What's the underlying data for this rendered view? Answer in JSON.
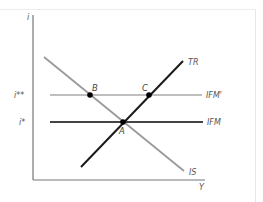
{
  "diagram": {
    "type": "economics-graph",
    "axes": {
      "y_label": "i",
      "x_label": "Y"
    },
    "y_ticks": [
      {
        "label": "i**",
        "refers_to": "IFM'"
      },
      {
        "label": "i*",
        "refers_to": "IFM"
      }
    ],
    "curves": [
      {
        "id": "IS",
        "label": "IS",
        "color": "#9a9a9a",
        "description": "downward-sloping IS curve"
      },
      {
        "id": "TR",
        "label": "TR",
        "color": "#1a1a1a",
        "description": "upward-sloping TR curve"
      },
      {
        "id": "IFM",
        "label": "IFM",
        "color": "#444444",
        "description": "horizontal IFM line at i*"
      },
      {
        "id": "IFMp",
        "label": "IFM'",
        "color": "#a8a8a8",
        "description": "horizontal IFM' line at i**"
      }
    ],
    "points": [
      {
        "label": "A",
        "on": [
          "IS",
          "TR",
          "IFM"
        ]
      },
      {
        "label": "B",
        "on": [
          "IS",
          "IFM'"
        ]
      },
      {
        "label": "C",
        "on": [
          "TR",
          "IFM'"
        ]
      }
    ],
    "colors": {
      "axis": "#777777",
      "text": "#555555",
      "point": "#000000"
    }
  }
}
